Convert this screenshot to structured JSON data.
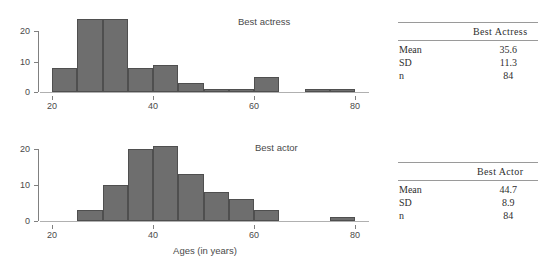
{
  "chart_data": [
    {
      "type": "bar",
      "title": "Best actress",
      "xlabel": "",
      "ylabel": "",
      "bin_width": 5,
      "xlim": [
        20,
        80
      ],
      "ylim": [
        0,
        25
      ],
      "xticks": [
        20,
        40,
        60,
        80
      ],
      "yticks": [
        0,
        10,
        20
      ],
      "grid": false,
      "bin_starts": [
        20,
        25,
        30,
        35,
        40,
        45,
        50,
        55,
        60,
        65,
        70,
        75
      ],
      "categories": [
        "20-25",
        "25-30",
        "30-35",
        "35-40",
        "40-45",
        "45-50",
        "50-55",
        "55-60",
        "60-65",
        "65-70",
        "70-75",
        "75-80"
      ],
      "values": [
        8,
        24,
        24,
        8,
        9,
        3,
        1,
        1,
        5,
        0,
        1,
        1
      ]
    },
    {
      "type": "bar",
      "title": "Best actor",
      "xlabel": "Ages (in years)",
      "ylabel": "",
      "bin_width": 5,
      "xlim": [
        20,
        80
      ],
      "ylim": [
        0,
        22
      ],
      "xticks": [
        20,
        40,
        60,
        80
      ],
      "yticks": [
        0,
        10,
        20
      ],
      "grid": false,
      "bin_starts": [
        20,
        25,
        30,
        35,
        40,
        45,
        50,
        55,
        60,
        65,
        70,
        75
      ],
      "categories": [
        "20-25",
        "25-30",
        "30-35",
        "35-40",
        "40-45",
        "45-50",
        "50-55",
        "55-60",
        "60-65",
        "65-70",
        "70-75",
        "75-80"
      ],
      "values": [
        0,
        3,
        10,
        20,
        21,
        13,
        8,
        6,
        3,
        0,
        0,
        1
      ]
    }
  ],
  "figure": {
    "axis_title": "Ages (in years)",
    "panels": [
      {
        "series_label": "Best actress",
        "x_tick_labels": [
          "20",
          "40",
          "60",
          "80"
        ],
        "y_tick_labels": [
          "0",
          "10",
          "20"
        ]
      },
      {
        "series_label": "Best actor",
        "x_tick_labels": [
          "20",
          "40",
          "60",
          "80"
        ],
        "y_tick_labels": [
          "0",
          "10",
          "20"
        ]
      }
    ]
  },
  "tables": [
    {
      "header_blank": "",
      "header": "Best Actress",
      "rows": [
        {
          "label": "Mean",
          "value": "35.6"
        },
        {
          "label": "SD",
          "value": "11.3"
        },
        {
          "label": "n",
          "value": "84"
        }
      ]
    },
    {
      "header_blank": "",
      "header": "Best Actor",
      "rows": [
        {
          "label": "Mean",
          "value": "44.7"
        },
        {
          "label": "SD",
          "value": "8.9"
        },
        {
          "label": "n",
          "value": "84"
        }
      ]
    }
  ],
  "colors": {
    "bar_fill": "#6e6e6e",
    "bar_stroke": "#4f4f4f",
    "axis": "#808080",
    "text": "#4a4a4a"
  }
}
